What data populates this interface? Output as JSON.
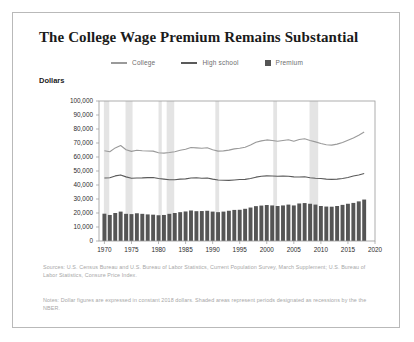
{
  "card": {
    "title": "The College Wage Premium Remains Substantial",
    "y_axis_label": "Dollars",
    "sources": "Sources: U.S. Census Bureau and U.S. Bureau of Labor Statistics, Current Population Survey, March Supplement; U.S. Bureau of Labor Statistics, Consure Price Index.",
    "notes": "Notes: Dollar figures are expressed in constant 2018 dollars. Shaded areas represent periods designated as recessions by the the NBER."
  },
  "colors": {
    "college_line": "#8d8d8d",
    "highschool_line": "#5a5a5a",
    "premium_bar": "#555555",
    "recession_band": "#e4e4e4",
    "axis": "#9a9a9a",
    "grid": "#d8d8d8",
    "text_muted": "#a7a7a7",
    "border": "#b9b9b9"
  },
  "legend": {
    "items": [
      {
        "label": "College",
        "marker": "line",
        "color": "#9a9a9a"
      },
      {
        "label": "High school",
        "marker": "line",
        "color": "#5a5a5a"
      },
      {
        "label": "Premium",
        "marker": "square",
        "color": "#555555"
      }
    ]
  },
  "chart_data": {
    "type": "bar",
    "title": "The College Wage Premium Remains Substantial",
    "xlabel": "",
    "ylabel": "Dollars",
    "ylim": [
      0,
      100000
    ],
    "xlim": [
      1969,
      2020
    ],
    "grid": false,
    "legend_position": "top-center",
    "ytick_labels": [
      "0",
      "10,000",
      "20,000",
      "30,000",
      "40,000",
      "50,000",
      "60,000",
      "70,000",
      "80,000",
      "90,000",
      "100,000"
    ],
    "ytick_values": [
      0,
      10000,
      20000,
      30000,
      40000,
      50000,
      60000,
      70000,
      80000,
      90000,
      100000
    ],
    "xtick_labels": [
      "1970",
      "1975",
      "1980",
      "1985",
      "1990",
      "1995",
      "2000",
      "2005",
      "2010",
      "2015",
      "2020"
    ],
    "xtick_values": [
      1970,
      1975,
      1980,
      1985,
      1990,
      1995,
      2000,
      2005,
      2010,
      2015,
      2020
    ],
    "x": [
      1970,
      1971,
      1972,
      1973,
      1974,
      1975,
      1976,
      1977,
      1978,
      1979,
      1980,
      1981,
      1982,
      1983,
      1984,
      1985,
      1986,
      1987,
      1988,
      1989,
      1990,
      1991,
      1992,
      1993,
      1994,
      1995,
      1996,
      1997,
      1998,
      1999,
      2000,
      2001,
      2002,
      2003,
      2004,
      2005,
      2006,
      2007,
      2008,
      2009,
      2010,
      2011,
      2012,
      2013,
      2014,
      2015,
      2016,
      2017,
      2018
    ],
    "series": [
      {
        "name": "College",
        "type": "line",
        "color": "#9a9a9a",
        "values": [
          64500,
          63800,
          66500,
          68200,
          65200,
          64000,
          64800,
          64500,
          64300,
          64200,
          63000,
          62800,
          63200,
          63700,
          64800,
          65500,
          66800,
          66500,
          66200,
          66600,
          65200,
          64200,
          64400,
          64900,
          65800,
          66200,
          67000,
          68500,
          70500,
          71500,
          72200,
          71800,
          71200,
          71800,
          72300,
          71200,
          72500,
          73000,
          71800,
          70800,
          69600,
          68800,
          68500,
          69200,
          70400,
          72000,
          73600,
          75500,
          77800
        ]
      },
      {
        "name": "High school",
        "type": "line",
        "color": "#5a5a5a",
        "values": [
          45000,
          45200,
          46500,
          47200,
          45800,
          44800,
          45000,
          45100,
          45300,
          45400,
          44600,
          44200,
          43800,
          43700,
          44200,
          44400,
          45000,
          45200,
          44800,
          45000,
          44200,
          43600,
          43400,
          43300,
          43600,
          43900,
          44000,
          44600,
          45600,
          46200,
          46500,
          46400,
          46200,
          46400,
          46300,
          45800,
          45700,
          45900,
          45200,
          44800,
          44600,
          44200,
          44000,
          44200,
          44600,
          45400,
          46400,
          47200,
          48200
        ]
      },
      {
        "name": "Premium",
        "type": "bar",
        "color": "#555555",
        "values": [
          19500,
          18600,
          20000,
          21000,
          19400,
          19200,
          19800,
          19400,
          19000,
          18800,
          18400,
          18600,
          19400,
          20000,
          20600,
          21100,
          21800,
          21300,
          21400,
          21600,
          21000,
          20600,
          21000,
          21600,
          22200,
          22300,
          23000,
          23900,
          24900,
          25300,
          25700,
          25400,
          25000,
          25400,
          26000,
          25400,
          26800,
          27100,
          26600,
          26000,
          25000,
          24600,
          24500,
          25000,
          25800,
          26600,
          27200,
          28300,
          29600
        ]
      }
    ],
    "recession_bands": [
      {
        "start": 1969.9,
        "end": 1970.9
      },
      {
        "start": 1973.9,
        "end": 1975.2
      },
      {
        "start": 1980.0,
        "end": 1980.6
      },
      {
        "start": 1981.5,
        "end": 1982.9
      },
      {
        "start": 1990.5,
        "end": 1991.2
      },
      {
        "start": 2001.2,
        "end": 2001.9
      },
      {
        "start": 2007.9,
        "end": 2009.5
      }
    ]
  }
}
